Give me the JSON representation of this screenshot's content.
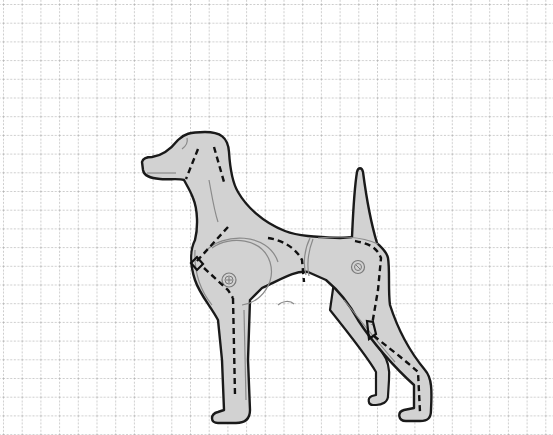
{
  "figure": {
    "title": "Dog anatomy illustration on grid",
    "background": "grid-paper",
    "grid": {
      "spacing_px": 18.7,
      "origin_x": 3,
      "origin_y": 4,
      "line_style": "dotted",
      "line_color": "#9a9a9a"
    },
    "colors": {
      "body_fill": "#d2d2d2",
      "outline": "#1a1a1a",
      "guide_dashes": "#111111",
      "inner_contours": "#8a8a8a",
      "background": "#ffffff"
    },
    "parts": [
      {
        "name": "head",
        "label": "Head"
      },
      {
        "name": "neck",
        "label": "Neck"
      },
      {
        "name": "shoulder",
        "label": "Shoulder joint"
      },
      {
        "name": "chest",
        "label": "Chest"
      },
      {
        "name": "torso",
        "label": "Torso"
      },
      {
        "name": "hip",
        "label": "Hip joint"
      },
      {
        "name": "tail",
        "label": "Tail"
      },
      {
        "name": "front-leg",
        "label": "Front leg"
      },
      {
        "name": "hind-leg",
        "label": "Hind leg"
      }
    ]
  }
}
